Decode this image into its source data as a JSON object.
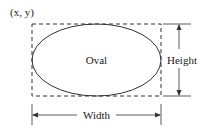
{
  "diagram": {
    "origin_label": "(x, y)",
    "shape_label": "Oval",
    "height_label": "Height",
    "width_label": "Width",
    "colors": {
      "stroke": "#333333",
      "text": "#222222",
      "background": "#ffffff"
    }
  }
}
